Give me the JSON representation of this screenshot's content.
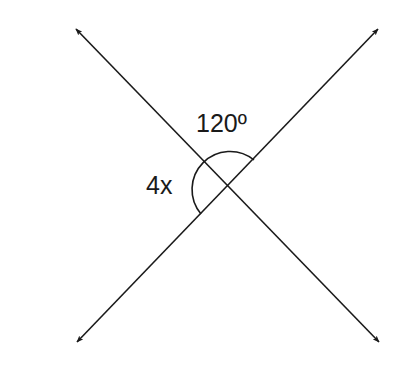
{
  "diagram": {
    "type": "intersecting-lines-angles",
    "stroke_color": "#1a1a1a",
    "background": "#ffffff",
    "intersection": {
      "x": 228,
      "y": 187
    },
    "lines": [
      {
        "name": "line-a",
        "from": {
          "x": 77,
          "y": 342
        },
        "to": {
          "x": 378,
          "y": 29
        },
        "arrows": "both"
      },
      {
        "name": "line-b",
        "from": {
          "x": 76,
          "y": 29
        },
        "to": {
          "x": 379,
          "y": 342
        },
        "arrows": "both"
      }
    ],
    "angles": [
      {
        "label": "120º",
        "text": "120º",
        "position": "top"
      },
      {
        "label": "4x",
        "text": "4x",
        "position": "left"
      }
    ]
  }
}
